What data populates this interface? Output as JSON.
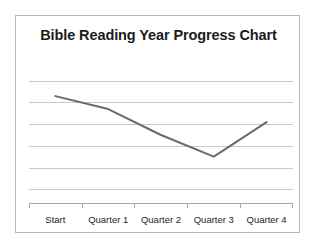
{
  "chart_data": {
    "type": "line",
    "title": "Bible Reading Year Progress Chart",
    "xlabel": "",
    "ylabel": "",
    "categories": [
      "Start",
      "Quarter 1",
      "Quarter 2",
      "Quarter 3",
      "Quarter 4"
    ],
    "series": [
      {
        "name": "Progress",
        "values": [
          4.3,
          3.7,
          2.5,
          1.5,
          3.1
        ],
        "color": "#6b6b6b"
      }
    ],
    "ylim": [
      0,
      5
    ],
    "y_gridline_values": [
      5,
      4,
      3,
      2,
      1,
      0
    ],
    "grid": true,
    "grid_color": "#c9c9c9",
    "legend": false,
    "legend_position": "none",
    "axis_color": "#a6a6a6",
    "plot_background": "#ffffff"
  },
  "frame": {
    "border_color": "#b8b8b8",
    "background": "#ffffff"
  },
  "title": {
    "text": "Bible Reading Year Progress Chart",
    "color": "#1b1b1b"
  },
  "axis": {
    "categories": [
      {
        "label": "Start"
      },
      {
        "label": "Quarter 1"
      },
      {
        "label": "Quarter 2"
      },
      {
        "label": "Quarter 3"
      },
      {
        "label": "Quarter 4"
      }
    ]
  }
}
